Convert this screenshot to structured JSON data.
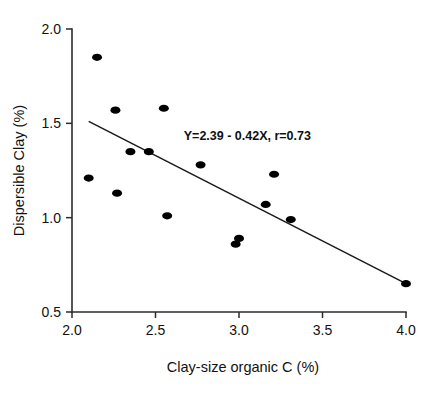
{
  "chart_data": {
    "type": "scatter",
    "title": "",
    "xlabel": "Clay-size organic C (%)",
    "ylabel": "Dispersible Clay (%)",
    "xlim": [
      2.0,
      4.0
    ],
    "ylim": [
      0.5,
      2.0
    ],
    "xticks": [
      "2.0",
      "2.5",
      "3.0",
      "3.5",
      "4.0"
    ],
    "xtick_values": [
      2.0,
      2.5,
      3.0,
      3.5,
      4.0
    ],
    "yticks": [
      "0.5",
      "1.0",
      "1.5",
      "2.0"
    ],
    "ytick_values": [
      0.5,
      1.0,
      1.5,
      2.0
    ],
    "grid": false,
    "legend": null,
    "annotation": "Y=2.39 - 0.42X, r=0.73",
    "annotation_x": 3.05,
    "annotation_y": 1.41,
    "regression": {
      "intercept": 2.39,
      "slope": -0.42,
      "r": 0.73,
      "x_start": 2.1,
      "x_end": 4.0,
      "y_start": 1.51,
      "y_end": 0.65
    },
    "points": [
      {
        "x": 2.15,
        "y": 1.85
      },
      {
        "x": 2.26,
        "y": 1.57
      },
      {
        "x": 2.55,
        "y": 1.58
      },
      {
        "x": 2.1,
        "y": 1.21
      },
      {
        "x": 2.27,
        "y": 1.13
      },
      {
        "x": 2.35,
        "y": 1.35
      },
      {
        "x": 2.46,
        "y": 1.35
      },
      {
        "x": 2.57,
        "y": 1.01
      },
      {
        "x": 2.77,
        "y": 1.28
      },
      {
        "x": 3.0,
        "y": 0.89
      },
      {
        "x": 2.98,
        "y": 0.86
      },
      {
        "x": 3.16,
        "y": 1.07
      },
      {
        "x": 3.21,
        "y": 1.23
      },
      {
        "x": 3.31,
        "y": 0.99
      },
      {
        "x": 4.0,
        "y": 0.65
      }
    ],
    "point_style": {
      "color": "#000000",
      "marker": "ellipse",
      "rx": 5.0,
      "ry": 3.6
    }
  }
}
